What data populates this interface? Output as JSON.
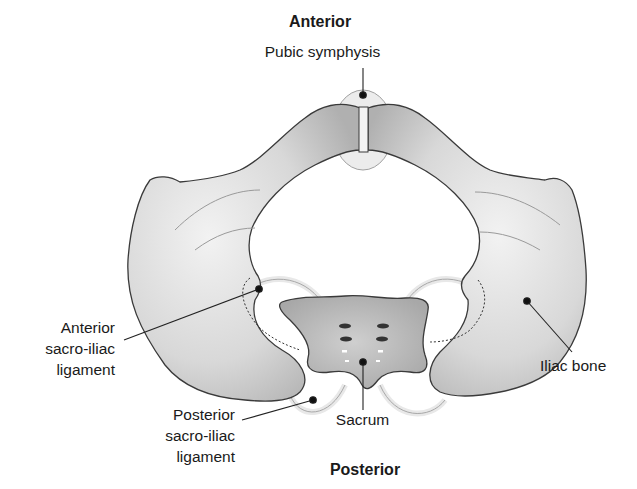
{
  "orientation": {
    "top": "Anterior",
    "bottom": "Posterior"
  },
  "labels": {
    "pubic_symphysis": "Pubic symphysis",
    "anterior_si_ligament": [
      "Anterior",
      "sacro-iliac",
      "ligament"
    ],
    "posterior_si_ligament": [
      "Posterior",
      "sacro-iliac",
      "ligament"
    ],
    "sacrum": "Sacrum",
    "iliac_bone": "Iliac bone"
  },
  "colors": {
    "bone_fill": "#d9d9d9",
    "bone_shade": "#b5b5b5",
    "outline": "#3a3a3a",
    "ligament": "#e6e6e6",
    "text": "#1a1a1a"
  }
}
